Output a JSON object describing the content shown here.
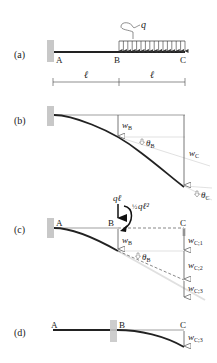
{
  "panels": {
    "a": {
      "label": "(a)",
      "points": [
        "A",
        "B",
        "C"
      ],
      "load": "q",
      "span_left": "ℓ",
      "span_right": "ℓ"
    },
    "b": {
      "label": "(b)",
      "wB": "w",
      "wB_sub": "B",
      "thetaB": "θ",
      "thetaB_sub": "B",
      "wC": "w",
      "wC_sub": "C",
      "thetaC": "θ",
      "thetaC_sub": "C"
    },
    "c": {
      "label": "(c)",
      "points": [
        "A",
        "B",
        "C"
      ],
      "force": "qℓ",
      "moment_frac": "½",
      "moment": "qℓ²",
      "wB": "w",
      "wB_sub": "B",
      "thetaB": "θ",
      "thetaB_sub": "B",
      "wC1": "w",
      "wC1_sub": "C;1",
      "wC2": "w",
      "wC2_sub": "C;2",
      "wC3": "w",
      "wC3_sub": "C;3"
    },
    "d": {
      "label": "(d)",
      "points": [
        "A",
        "B",
        "C"
      ],
      "wC3": "w",
      "wC3_sub": "C;3"
    }
  },
  "colors": {
    "beam": "#222222",
    "wall": "#c8c8c8",
    "guide": "#d0d0d0",
    "line": "#555555"
  }
}
